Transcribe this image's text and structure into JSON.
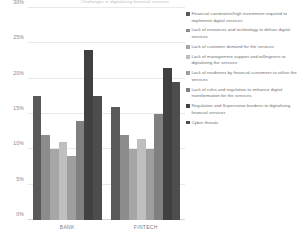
{
  "chart_data": {
    "type": "bar",
    "title": "Challenges in digitalising financial services",
    "xlabel": "",
    "ylabel": "",
    "categories": [
      "BANK",
      "FINTECH"
    ],
    "ylim": [
      0,
      30
    ],
    "yticks": [
      "0%",
      "5%",
      "10%",
      "15%",
      "20%",
      "25%",
      "30%"
    ],
    "ytick_values": [
      0,
      5,
      10,
      15,
      20,
      25,
      30
    ],
    "grid": true,
    "legend_position": "right",
    "series": [
      {
        "name": "Financial constraints/high investment required to implement digital services",
        "color": "#595959",
        "values": [
          17.5,
          16.0
        ]
      },
      {
        "name": "Lack of resources and technology to deliver digital services",
        "color": "#8c8c8c",
        "values": [
          12.0,
          12.0
        ]
      },
      {
        "name": "Lack of customer demand for the services",
        "color": "#a6a6a6",
        "values": [
          10.0,
          10.0
        ]
      },
      {
        "name": "Lack of management support and willingness to digitalising the services",
        "color": "#bfbfbf",
        "values": [
          11.0,
          11.5
        ]
      },
      {
        "name": "Lack of readiness by financial customers to utilise the services",
        "color": "#9e9e9e",
        "values": [
          9.0,
          10.0
        ]
      },
      {
        "name": "Lack of rules and regulation to enhance digital transformation for the services",
        "color": "#808080",
        "values": [
          14.0,
          15.0
        ]
      },
      {
        "name": "Regulation and Supervision burdens to digitalising financial services",
        "color": "#404040",
        "values": [
          24.0,
          21.5
        ]
      },
      {
        "name": "Cyber threats",
        "color": "#4d4d4d",
        "values": [
          17.5,
          19.5
        ]
      }
    ]
  }
}
